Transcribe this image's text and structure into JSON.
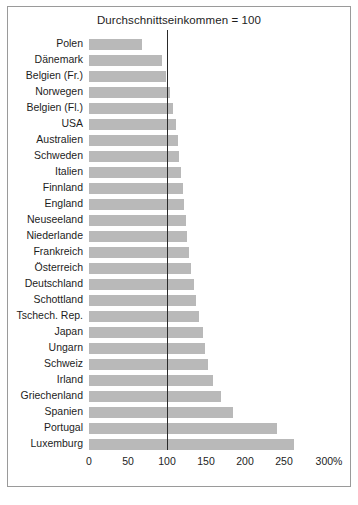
{
  "chart_data": {
    "type": "bar",
    "orientation": "horizontal",
    "title": "Durchschnittseinkommen = 100",
    "xlabel": "",
    "ylabel": "",
    "xlim": [
      0,
      300
    ],
    "xticks": [
      0,
      50,
      100,
      150,
      200,
      250,
      300
    ],
    "xtick_labels": [
      "0",
      "50",
      "100",
      "150",
      "200",
      "250",
      "300%"
    ],
    "unit": "%",
    "grid": false,
    "legend": null,
    "reference_line": {
      "value": 100,
      "label": "Durchschnittseinkommen = 100",
      "color": "#2a2a2a"
    },
    "bar_color": "#b9b9b9",
    "categories": [
      "Polen",
      "Dänemark",
      "Belgien (Fr.)",
      "Norwegen",
      "Belgien (Fl.)",
      "USA",
      "Australien",
      "Schweden",
      "Italien",
      "Finnland",
      "England",
      "Neuseeland",
      "Niederlande",
      "Frankreich",
      "Österreich",
      "Deutschland",
      "Schottland",
      "Tschech. Rep.",
      "Japan",
      "Ungarn",
      "Schweiz",
      "Irland",
      "Griechenland",
      "Spanien",
      "Portugal",
      "Luxemburg"
    ],
    "values": [
      68,
      93,
      99,
      104,
      108,
      112,
      114,
      116,
      118,
      120,
      122,
      124,
      126,
      128,
      131,
      134,
      137,
      141,
      146,
      149,
      153,
      159,
      169,
      184,
      241,
      263
    ]
  },
  "figure": {
    "border_color": "#9a9a9a",
    "background": "#ffffff"
  }
}
